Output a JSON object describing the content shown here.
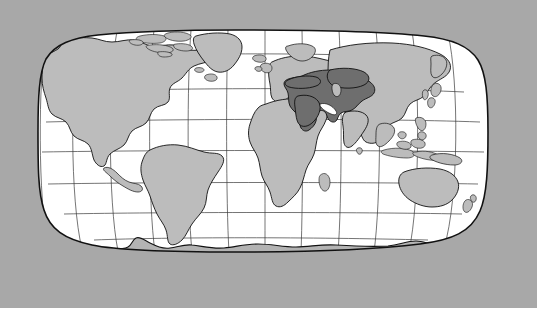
{
  "figure": {
    "kind": "world-locator-map",
    "projection": "Robinson",
    "canvas": {
      "width": 537,
      "height": 312
    }
  },
  "colors": {
    "background": "#a8a8a8",
    "ocean": "#ffffff",
    "land": "#bcbcbc",
    "highlight": "#6e6e6e",
    "outline": "#111111",
    "graticule": "#3a3a3a",
    "bottom_strip": "#ffffff"
  },
  "legend": {
    "highlighted_region_label": "Middle East and Central Asia",
    "base_region_label": "Other land areas",
    "ocean_label": "Ocean"
  },
  "graticule": {
    "parallels_degrees": [
      80,
      60,
      40,
      20,
      0,
      -20,
      -40,
      -60
    ],
    "meridians_degrees": [
      -180,
      -150,
      -120,
      -90,
      -60,
      -30,
      0,
      30,
      60,
      90,
      120,
      150,
      180
    ],
    "interval_degrees": 30,
    "grid_visible": true
  },
  "highlighted_countries": [
    "Turkey",
    "Syria",
    "Lebanon",
    "Israel",
    "Jordan",
    "Iraq",
    "Saudi Arabia",
    "Yemen",
    "Oman",
    "United Arab Emirates",
    "Qatar",
    "Bahrain",
    "Kuwait",
    "Iran",
    "Afghanistan",
    "Turkmenistan",
    "Uzbekistan",
    "Tajikistan",
    "Kyrgyzstan",
    "Kazakhstan",
    "Pakistan",
    "Azerbaijan",
    "Armenia",
    "Georgia"
  ],
  "landmasses": [
    "North America",
    "Greenland",
    "South America",
    "Europe",
    "Africa",
    "Asia",
    "Australia",
    "New Zealand",
    "Antarctica",
    "Japan",
    "Indonesia",
    "Philippines",
    "Madagascar",
    "British Isles",
    "Iceland"
  ]
}
